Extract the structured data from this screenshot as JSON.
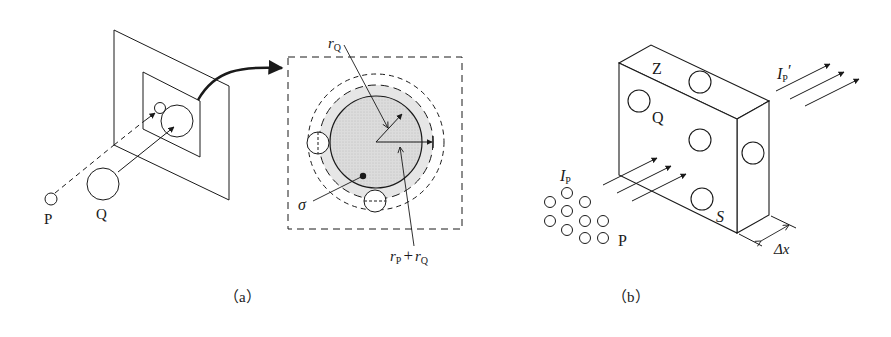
{
  "panels": {
    "a": {
      "caption": "（a）",
      "labels": {
        "P": "P",
        "Q": "Q",
        "rQ": "r",
        "rQ_sub": "Q",
        "sigma": "σ",
        "rPrQ_1": "r",
        "rPrQ_1_sub": "P",
        "rPrQ_plus": "+",
        "rPrQ_2": "r",
        "rPrQ_2_sub": "Q"
      }
    },
    "b": {
      "caption": "（b）",
      "labels": {
        "Z": "Z",
        "Q": "Q",
        "S": "S",
        "P": "P",
        "IP": "I",
        "IP_sub": "P",
        "IPprime": "I",
        "IPprime_sub": "P",
        "IPprime_mark": "′",
        "dx": "Δx"
      }
    }
  },
  "colors": {
    "ink": "#1a1a1a",
    "shade": "#d9d9d9",
    "background": "#ffffff"
  }
}
